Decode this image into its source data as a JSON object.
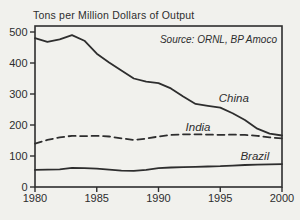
{
  "chart": {
    "title": "Tons per Million Dollars of Output",
    "source": "Source: ORNL, BP Amoco"
  },
  "chart_data": {
    "type": "line",
    "title": "Tons per Million Dollars of Output",
    "source_annotation": "Source: ORNL, BP Amoco",
    "xlabel": "",
    "ylabel": "Tons per Million Dollars of Output",
    "xlim": [
      1980,
      2000
    ],
    "ylim": [
      0,
      500
    ],
    "x_ticks": [
      1980,
      1985,
      1990,
      1995,
      2000
    ],
    "y_ticks": [
      0,
      100,
      200,
      300,
      400,
      500
    ],
    "grid": false,
    "legend_position": "inline-labels",
    "line_color": "#2e2e2e",
    "x": [
      1980,
      1981,
      1982,
      1983,
      1984,
      1985,
      1986,
      1987,
      1988,
      1989,
      1990,
      1991,
      1992,
      1993,
      1994,
      1995,
      1996,
      1997,
      1998,
      1999,
      2000
    ],
    "series": [
      {
        "name": "China",
        "line_style": "solid",
        "label_anchor": {
          "x": 1996.1,
          "y": 288
        },
        "values": [
          480,
          468,
          476,
          490,
          472,
          430,
          402,
          376,
          350,
          340,
          335,
          318,
          292,
          268,
          262,
          256,
          238,
          216,
          188,
          172,
          166
        ]
      },
      {
        "name": "India",
        "line_style": "dashed",
        "label_anchor": {
          "x": 1993.2,
          "y": 193
        },
        "values": [
          140,
          152,
          160,
          165,
          164,
          165,
          163,
          157,
          152,
          156,
          163,
          168,
          170,
          170,
          169,
          168,
          169,
          168,
          165,
          160,
          157
        ]
      },
      {
        "name": "Brazil",
        "line_style": "solid",
        "label_anchor": {
          "x": 1997.8,
          "y": 100
        },
        "values": [
          55,
          56,
          57,
          62,
          61,
          59,
          56,
          53,
          52,
          55,
          61,
          63,
          64,
          65,
          66,
          67,
          69,
          71,
          72,
          73,
          74
        ]
      }
    ]
  }
}
